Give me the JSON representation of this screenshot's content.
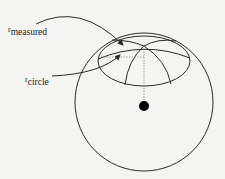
{
  "diagram": {
    "type": "geometry",
    "labels": {
      "measured": {
        "symbol": "r",
        "subscript": "measured"
      },
      "circle": {
        "symbol": "r",
        "subscript": "circle"
      }
    },
    "colors": {
      "stroke": "#2a2a2a",
      "background": "#f4f4f2",
      "center_dot": "#000000",
      "dotted": "#777777"
    }
  }
}
